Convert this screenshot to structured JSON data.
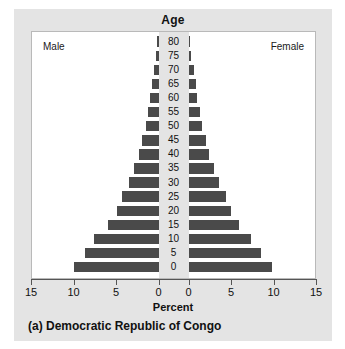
{
  "figure": {
    "age_axis_title": "Age",
    "percent_axis_title": "Percent",
    "caption": "(a) Democratic Republic of Congo",
    "male_label": "Male",
    "female_label": "Female",
    "bar_color": "#4a4a4a",
    "panel_background": "#ffffff",
    "card_background": "#e4e4e4"
  },
  "chart_data": {
    "type": "bar",
    "subtype": "population-pyramid",
    "title": "Age",
    "xlabel": "Percent",
    "ylabel": "Age",
    "grid": false,
    "legend": [
      "Male",
      "Female"
    ],
    "legend_position": "inside-top-corners",
    "xlim": [
      0,
      15
    ],
    "xticks": [
      15,
      10,
      5,
      0,
      0,
      5,
      10,
      15
    ],
    "xticks_left": [
      15,
      10,
      5,
      0
    ],
    "xticks_right": [
      0,
      5,
      10,
      15
    ],
    "categories": [
      "0",
      "5",
      "10",
      "15",
      "20",
      "25",
      "30",
      "35",
      "40",
      "45",
      "50",
      "55",
      "60",
      "65",
      "70",
      "75",
      "80"
    ],
    "series": [
      {
        "name": "Male",
        "side": "left",
        "values": [
          10.0,
          8.6,
          7.6,
          6.0,
          4.9,
          4.3,
          3.5,
          2.9,
          2.3,
          1.9,
          1.5,
          1.2,
          1.0,
          0.8,
          0.55,
          0.3,
          0.15
        ]
      },
      {
        "name": "Female",
        "side": "right",
        "values": [
          9.8,
          8.5,
          7.4,
          5.9,
          5.0,
          4.4,
          3.6,
          3.0,
          2.4,
          2.0,
          1.6,
          1.3,
          1.05,
          0.85,
          0.6,
          0.35,
          0.2
        ]
      }
    ]
  }
}
